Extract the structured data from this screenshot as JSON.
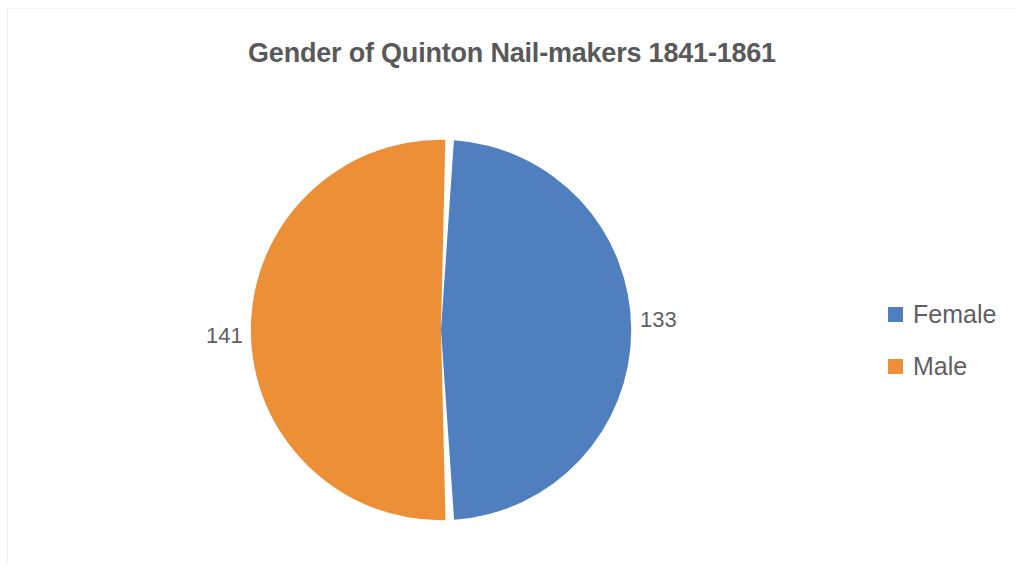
{
  "chart_data": {
    "type": "pie",
    "title": "Gender of Quinton Nail-makers 1841-1861",
    "categories": [
      "Female",
      "Male"
    ],
    "values": [
      133,
      141
    ],
    "labels": [
      "133",
      "141"
    ],
    "total": 274,
    "colors": [
      "#4F7FBE",
      "#ED8F37"
    ],
    "legend_position": "right",
    "grid": false,
    "xlabel": "",
    "ylabel": "",
    "slices": [
      {
        "name": "Female",
        "value": 133,
        "label": "133",
        "color": "#4F7FBE",
        "percent": 48.5,
        "start_angle_deg": 2.6,
        "sweep_deg": 174.7
      },
      {
        "name": "Male",
        "value": 141,
        "label": "141",
        "color": "#ED8F37",
        "percent": 51.5,
        "start_angle_deg": 177.3,
        "sweep_deg": 185.3
      }
    ]
  },
  "chart": {
    "title": "Gender of Quinton Nail-makers 1841-1861",
    "label_female": "133",
    "label_male": "141"
  },
  "legend": {
    "items": [
      {
        "label": "Female",
        "color": "#4F7FBE"
      },
      {
        "label": "Male",
        "color": "#ED8F37"
      }
    ]
  }
}
